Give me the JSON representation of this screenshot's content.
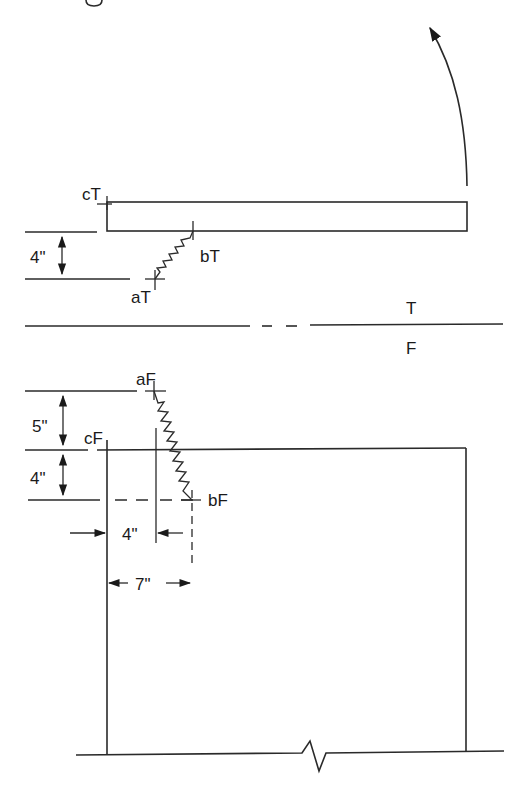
{
  "diagram": {
    "type": "mechanical-spring-hinge-schematic",
    "top_view": {
      "section_label": "T",
      "points": {
        "cT": "cT",
        "bT": "bT",
        "aT": "aT"
      },
      "dimension_vertical": "4\""
    },
    "bottom_view": {
      "section_label": "F",
      "points": {
        "aF": "aF",
        "cF": "cF",
        "bF": "bF"
      },
      "dimension_vertical_upper": "5\"",
      "dimension_vertical_lower": "4\"",
      "dimension_horizontal_inner": "4\"",
      "dimension_horizontal_outer": "7\""
    },
    "colors": {
      "line": "#2a2a2a",
      "background": "#ffffff"
    }
  }
}
